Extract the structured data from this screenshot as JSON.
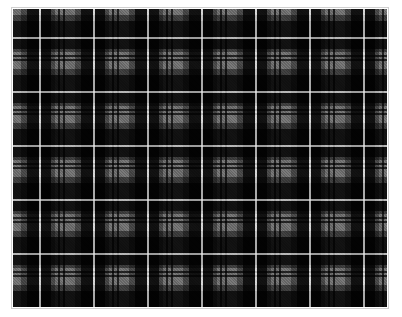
{
  "image": {
    "subject": "tartan-plaid-fabric",
    "description": "Black and grey tartan pattern with thin white overcheck lines",
    "colors": {
      "black": "#0a0a0a",
      "dark_grey": "#3c3c3c",
      "grey": "#7a7a7a",
      "light_grey": "#9a9a9a",
      "white_line": "#e0e0e0",
      "frame_border": "#cfcfcf",
      "background": "#ffffff"
    },
    "sett_repeat_px": 54
  }
}
